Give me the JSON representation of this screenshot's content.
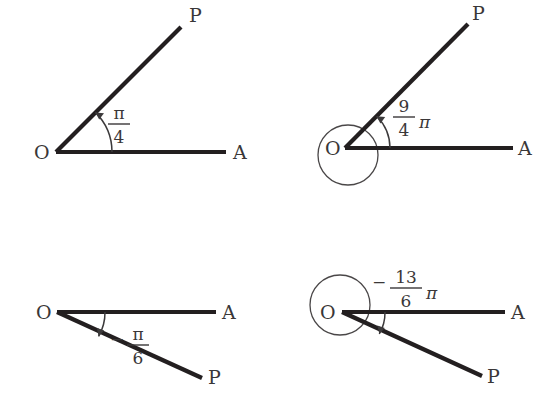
{
  "page": {
    "background_color": "#ffffff",
    "ink_color": "#231f20",
    "width": 555,
    "height": 402
  },
  "figures": [
    {
      "id": "fig-top-left",
      "vertex_label": "O",
      "terminal_label": "P",
      "initial_label": "A",
      "angle": {
        "minus": "",
        "numerator": "π",
        "denominator": "4",
        "pi_suffix": "",
        "value_text": "π/4",
        "direction": "counterclockwise",
        "full_turns": 0
      },
      "has_loop_circle": false
    },
    {
      "id": "fig-top-right",
      "vertex_label": "O",
      "terminal_label": "P",
      "initial_label": "A",
      "angle": {
        "minus": "",
        "numerator": "9",
        "denominator": "4",
        "pi_suffix": "π",
        "value_text": "9/4 π",
        "direction": "counterclockwise",
        "full_turns": 1
      },
      "has_loop_circle": true
    },
    {
      "id": "fig-bottom-left",
      "vertex_label": "O",
      "terminal_label": "P",
      "initial_label": "A",
      "angle": {
        "minus": "−",
        "numerator": "π",
        "denominator": "6",
        "pi_suffix": "",
        "value_text": "−π/6",
        "direction": "clockwise",
        "full_turns": 0
      },
      "has_loop_circle": false
    },
    {
      "id": "fig-bottom-right",
      "vertex_label": "O",
      "terminal_label": "P",
      "initial_label": "A",
      "angle": {
        "minus": "−",
        "numerator": "13",
        "denominator": "6",
        "pi_suffix": "π",
        "value_text": "−13/6 π",
        "direction": "clockwise",
        "full_turns": 1
      },
      "has_loop_circle": true
    }
  ]
}
